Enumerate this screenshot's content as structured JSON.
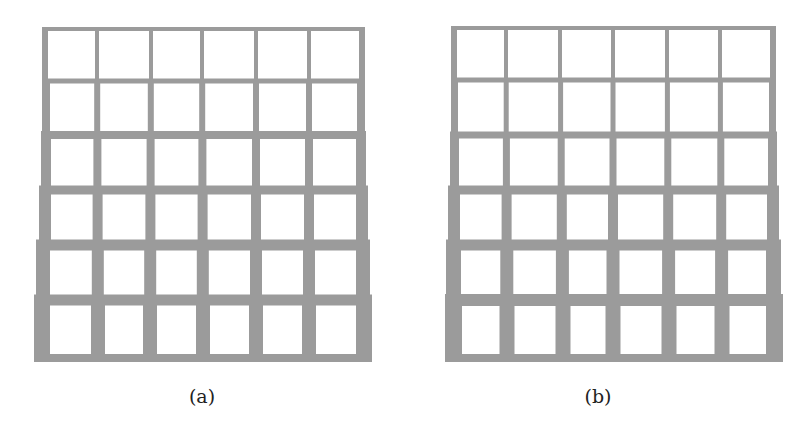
{
  "colors": {
    "member": "#9b9b9b",
    "background": "#ffffff"
  },
  "figures": [
    {
      "id": "a",
      "caption": "(a)",
      "caption_x": 172,
      "caption_y": 385,
      "rows_y": [
        27,
        81,
        135,
        190,
        245,
        300,
        355
      ],
      "h_thickness": [
        4,
        5,
        8,
        9,
        11,
        11,
        8
      ],
      "cols_x_top": [
        44,
        97,
        151,
        202,
        256,
        309,
        362
      ],
      "cols_x_bottom": [
        37,
        98,
        150,
        203,
        256,
        309,
        363
      ],
      "v_thickness": [
        4,
        6,
        8,
        10,
        12,
        14
      ],
      "left_outer": [
        42,
        42,
        41,
        39,
        36,
        34
      ],
      "right_outer": [
        365,
        365,
        366,
        368,
        370,
        372
      ],
      "bottom_extras": []
    },
    {
      "id": "b",
      "caption": "(b)",
      "caption_x": 568,
      "caption_y": 385,
      "rows_y": [
        26,
        80,
        135,
        190,
        245,
        300,
        355
      ],
      "h_thickness": [
        4,
        5,
        7,
        9,
        11,
        12,
        8
      ],
      "cols_x_top": [
        453,
        506,
        560,
        613,
        667,
        720,
        774
      ],
      "cols_x_bottom": [
        450,
        507,
        563,
        613,
        669,
        722,
        777
      ],
      "v_thickness": [
        4,
        5,
        7,
        10,
        13,
        15
      ],
      "left_outer": [
        451,
        451,
        450,
        448,
        446,
        445
      ],
      "right_outer": [
        776,
        776,
        777,
        779,
        781,
        783
      ],
      "bottom_extras": [
        {
          "x": 507,
          "w": 53,
          "y": 355,
          "h": 7
        },
        {
          "x": 667,
          "w": 53,
          "y": 355,
          "h": 7
        }
      ]
    }
  ]
}
